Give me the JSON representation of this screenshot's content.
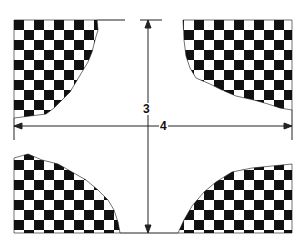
{
  "diagram": {
    "dimensions": {
      "vertical_label": "3",
      "horizontal_label": "4"
    },
    "colors": {
      "dark": "#111111",
      "light": "#ffffff",
      "line": "#222222"
    }
  }
}
